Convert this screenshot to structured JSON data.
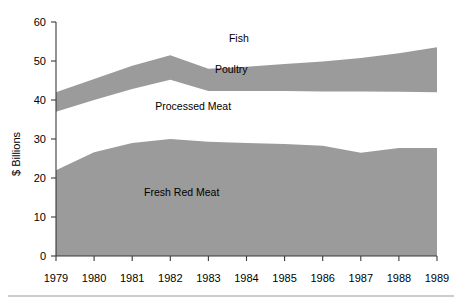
{
  "chart_data": {
    "type": "area",
    "title": "",
    "subtitle": "",
    "xlabel": "",
    "ylabel": "$ Billions",
    "grid": false,
    "legend_position": "inline-labels",
    "stacked": false,
    "x": [
      1979,
      1980,
      1981,
      1982,
      1983,
      1984,
      1985,
      1986,
      1987,
      1988,
      1989
    ],
    "xtick_labels": [
      "1979",
      "1980",
      "1981",
      "1982",
      "1983",
      "1984",
      "1985",
      "1986",
      "1987",
      "1988",
      "1989"
    ],
    "ytick_labels": [
      "0",
      "10",
      "20",
      "30",
      "40",
      "50",
      "60"
    ],
    "yticks": [
      0,
      10,
      20,
      30,
      40,
      50,
      60
    ],
    "ylim": [
      0,
      60
    ],
    "xlim": [
      1979,
      1989
    ],
    "bands": [
      {
        "name": "Fish",
        "label": "Fish",
        "filled": false,
        "color": "#ffffff",
        "note": "region above the Poultry band, unshaded",
        "top": [
          60,
          60,
          60,
          60,
          60,
          60,
          60,
          60,
          60,
          60,
          60
        ],
        "bottom": [
          42.0,
          45.4,
          48.8,
          51.5,
          48.0,
          48.5,
          49.2,
          49.9,
          50.8,
          52.0,
          53.5
        ]
      },
      {
        "name": "Poultry",
        "label": "Poultry",
        "filled": true,
        "color": "#9b9b9b",
        "top": [
          42.0,
          45.4,
          48.8,
          51.5,
          48.0,
          48.5,
          49.2,
          49.9,
          50.8,
          52.0,
          53.5
        ],
        "bottom": [
          37.0,
          40.0,
          42.8,
          45.2,
          42.3,
          42.3,
          42.3,
          42.2,
          42.2,
          42.1,
          42.0
        ]
      },
      {
        "name": "Processed Meat",
        "label": "Processed Meat",
        "filled": false,
        "color": "#ffffff",
        "note": "unshaded region between Poultry band and Fresh Red Meat area",
        "top": [
          37.0,
          40.0,
          42.8,
          45.2,
          42.3,
          42.3,
          42.3,
          42.2,
          42.2,
          42.1,
          42.0
        ],
        "bottom": [
          22.0,
          26.6,
          29.0,
          30.0,
          29.3,
          29.0,
          28.7,
          28.3,
          26.5,
          27.7,
          27.7
        ]
      },
      {
        "name": "Fresh Red Meat",
        "label": "Fresh Red Meat",
        "filled": true,
        "color": "#9b9b9b",
        "top": [
          22.0,
          26.6,
          29.0,
          30.0,
          29.3,
          29.0,
          28.7,
          28.3,
          26.5,
          27.7,
          27.7
        ],
        "bottom": [
          0,
          0,
          0,
          0,
          0,
          0,
          0,
          0,
          0,
          0,
          0
        ]
      }
    ],
    "series": [
      {
        "name": "Fresh Red Meat",
        "values": [
          22.0,
          26.6,
          29.0,
          30.0,
          29.3,
          29.0,
          28.7,
          28.3,
          26.5,
          27.7,
          27.7
        ]
      },
      {
        "name": "Processed Meat",
        "values": [
          15.0,
          13.4,
          13.8,
          15.2,
          13.0,
          13.3,
          13.6,
          13.9,
          15.7,
          14.4,
          14.3
        ]
      },
      {
        "name": "Poultry",
        "values": [
          5.0,
          5.4,
          6.0,
          6.3,
          5.7,
          6.2,
          6.9,
          7.7,
          8.6,
          9.9,
          11.5
        ]
      }
    ],
    "annotations": [
      {
        "text": "Fish",
        "x": 1983.8,
        "y": 55.0
      },
      {
        "text": "Poultry",
        "x": 1983.6,
        "y": 47.0
      },
      {
        "text": "Processed Meat",
        "x": 1982.6,
        "y": 37.5
      },
      {
        "text": "Fresh Red Meat",
        "x": 1982.3,
        "y": 15.5
      }
    ],
    "colors": {
      "band_fill": "#9b9b9b",
      "background": "#ffffff",
      "axis": "#3a3a3a",
      "text": "#000000",
      "footer_rule": "#9a9a9a"
    }
  }
}
